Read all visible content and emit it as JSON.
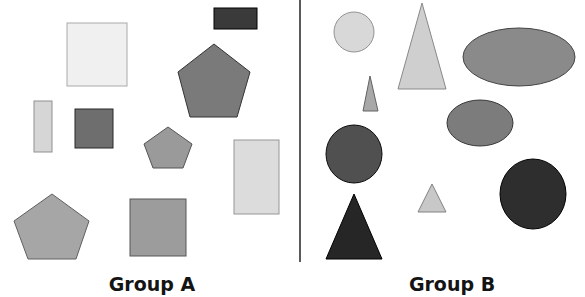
{
  "diagram": {
    "divider": {
      "x": 300,
      "y1": 0,
      "y2": 262,
      "color": "#5a5a5a"
    },
    "groups": [
      {
        "label": "Group A",
        "label_pos": {
          "x": 152,
          "y": 291
        },
        "shapes": [
          {
            "type": "rect",
            "name": "dark-rectangle",
            "x": 214,
            "y": 8,
            "w": 43,
            "h": 21,
            "fill": "#3a3a3a"
          },
          {
            "type": "rect",
            "name": "light-square-large",
            "x": 67,
            "y": 23,
            "w": 60,
            "h": 63,
            "fill": "#f0f0f0"
          },
          {
            "type": "polygon",
            "name": "dark-gray-pentagon-large",
            "points": "214,44 250,72 237,117 190,117 178,72",
            "fill": "#7a7a7a"
          },
          {
            "type": "rect",
            "name": "thin-light-rectangle",
            "x": 34,
            "y": 101,
            "w": 18,
            "h": 51,
            "fill": "#d6d6d6"
          },
          {
            "type": "rect",
            "name": "dark-gray-square-small",
            "x": 75,
            "y": 109,
            "w": 38,
            "h": 39,
            "fill": "#6e6e6e"
          },
          {
            "type": "polygon",
            "name": "gray-pentagon-small",
            "points": "168,127 192,144 183,168 153,168 144,144",
            "fill": "#9a9a9a"
          },
          {
            "type": "rect",
            "name": "light-tall-rectangle",
            "x": 234,
            "y": 140,
            "w": 45,
            "h": 74,
            "fill": "#dcdcdc"
          },
          {
            "type": "polygon",
            "name": "gray-pentagon-bottom-left",
            "points": "52,194 89,221 76,259 28,259 14,221",
            "fill": "#a6a6a6"
          },
          {
            "type": "rect",
            "name": "gray-square-bottom",
            "x": 130,
            "y": 199,
            "w": 56,
            "h": 57,
            "fill": "#9c9c9c"
          }
        ]
      },
      {
        "label": "Group B",
        "label_pos": {
          "x": 452,
          "y": 291
        },
        "shapes": [
          {
            "type": "ellipse",
            "name": "light-circle",
            "cx": 354,
            "cy": 32,
            "rx": 20,
            "ry": 20,
            "fill": "#d8d8d8"
          },
          {
            "type": "polygon",
            "name": "light-tall-triangle",
            "points": "422,3 446,89 398,89",
            "fill": "#cfcfcf"
          },
          {
            "type": "ellipse",
            "name": "gray-ellipse-large",
            "cx": 519,
            "cy": 57,
            "rx": 56,
            "ry": 29,
            "fill": "#8a8a8a"
          },
          {
            "type": "polygon",
            "name": "thin-gray-triangle",
            "points": "370,76 378,111 363,111",
            "fill": "#a8a8a8"
          },
          {
            "type": "ellipse",
            "name": "gray-ellipse-medium",
            "cx": 480,
            "cy": 123,
            "rx": 33,
            "ry": 23,
            "fill": "#7c7c7c"
          },
          {
            "type": "ellipse",
            "name": "dark-gray-circle",
            "cx": 354,
            "cy": 154,
            "rx": 28,
            "ry": 29,
            "fill": "#505050"
          },
          {
            "type": "polygon",
            "name": "small-light-triangle",
            "points": "432,184 446,212 418,212",
            "fill": "#c8c8c8"
          },
          {
            "type": "ellipse",
            "name": "dark-ellipse",
            "cx": 533,
            "cy": 194,
            "rx": 33,
            "ry": 35,
            "fill": "#2e2e2e"
          },
          {
            "type": "polygon",
            "name": "dark-triangle",
            "points": "354,194 382,259 326,259",
            "fill": "#262626"
          }
        ]
      }
    ]
  }
}
